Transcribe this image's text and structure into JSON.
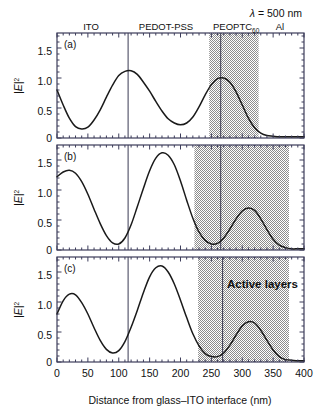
{
  "figure": {
    "wavelength_label": "λ = 500 nm",
    "xlabel": "Distance from glass–ITO interface (nm)",
    "ylabel_main": "|E|",
    "ylabel_exp": "2",
    "active_layers_label": "Active layers",
    "layer_labels": {
      "ito": "ITO",
      "pedot": "PEDOT-PSS",
      "blend_main": "PEOPTC",
      "blend_sub": "60",
      "al": "Al"
    },
    "panel_labels": {
      "a": "(a)",
      "b": "(b)",
      "c": "(c)"
    },
    "xticks": [
      "0",
      "50",
      "100",
      "150",
      "200",
      "250",
      "300",
      "350",
      "400"
    ],
    "yticks": [
      "0",
      "0.5",
      "1.0",
      "1.5"
    ],
    "colors": {
      "curve": "#1a1a1a",
      "axis": "#3c3c5a",
      "shade": "#9a9a9a",
      "interface_line": "#3a3a52",
      "background": "#ffffff"
    }
  },
  "chart_data": {
    "type": "line",
    "title": "",
    "subtitle": "λ = 500 nm",
    "xlabel": "Distance from glass–ITO interface (nm)",
    "ylabel": "|E|^2",
    "xlim": [
      0,
      400
    ],
    "ylim": [
      0,
      1.75
    ],
    "xticks": [
      0,
      50,
      100,
      150,
      200,
      250,
      300,
      350,
      400
    ],
    "yticks": [
      0,
      0.5,
      1.0,
      1.5
    ],
    "grid": false,
    "legend": "none",
    "panels": [
      {
        "label": "(a)",
        "shaded_region": {
          "x0": 220,
          "x1": 300,
          "fill": "hatched-gray",
          "name": "active layers"
        },
        "interface_lines": [
          115,
          265
        ],
        "layer_annotations": [
          {
            "text": "ITO",
            "x": 60
          },
          {
            "text": "PEDOT-PSS",
            "x": 165
          },
          {
            "text": "PEOPTC60",
            "x": 253
          },
          {
            "text": "Al",
            "x": 345
          }
        ],
        "x": [
          0,
          10,
          20,
          30,
          40,
          50,
          60,
          70,
          80,
          90,
          100,
          110,
          120,
          130,
          140,
          150,
          160,
          170,
          180,
          190,
          200,
          210,
          220,
          230,
          240,
          250,
          260,
          270,
          280,
          290,
          300,
          310,
          320,
          330,
          340,
          350,
          360,
          380,
          400
        ],
        "y": [
          0.8,
          0.55,
          0.33,
          0.19,
          0.15,
          0.18,
          0.3,
          0.47,
          0.68,
          0.88,
          1.04,
          1.11,
          1.12,
          1.06,
          0.93,
          0.78,
          0.61,
          0.45,
          0.32,
          0.25,
          0.22,
          0.25,
          0.35,
          0.52,
          0.72,
          0.89,
          0.99,
          1.0,
          0.93,
          0.77,
          0.55,
          0.33,
          0.17,
          0.08,
          0.04,
          0.03,
          0.02,
          0.02,
          0.02
        ]
      },
      {
        "label": "(b)",
        "shaded_region": {
          "x0": 222,
          "x1": 355,
          "fill": "solid-gray",
          "name": "active layers"
        },
        "interface_lines": [
          115,
          265
        ],
        "x": [
          0,
          10,
          20,
          30,
          40,
          50,
          60,
          70,
          80,
          90,
          100,
          110,
          120,
          130,
          140,
          150,
          160,
          170,
          180,
          190,
          200,
          210,
          220,
          230,
          240,
          250,
          260,
          270,
          280,
          290,
          300,
          310,
          320,
          330,
          340,
          350,
          360,
          370,
          380,
          390,
          400
        ],
        "y": [
          1.22,
          1.3,
          1.33,
          1.28,
          1.14,
          0.93,
          0.68,
          0.44,
          0.24,
          0.12,
          0.1,
          0.2,
          0.42,
          0.72,
          1.03,
          1.32,
          1.53,
          1.62,
          1.58,
          1.42,
          1.15,
          0.83,
          0.53,
          0.3,
          0.16,
          0.1,
          0.11,
          0.2,
          0.35,
          0.52,
          0.65,
          0.7,
          0.66,
          0.52,
          0.34,
          0.18,
          0.08,
          0.04,
          0.02,
          0.02,
          0.02
        ]
      },
      {
        "label": "(c)",
        "shaded_region": {
          "x0": 228,
          "x1": 355,
          "fill": "solid-gray",
          "name": "active layers"
        },
        "interface_lines": [
          115,
          268
        ],
        "annotation": "Active layers",
        "x": [
          0,
          10,
          20,
          30,
          40,
          50,
          60,
          70,
          80,
          90,
          100,
          110,
          120,
          130,
          140,
          150,
          160,
          170,
          180,
          190,
          200,
          210,
          220,
          230,
          240,
          250,
          260,
          270,
          280,
          290,
          300,
          310,
          320,
          330,
          340,
          350,
          360,
          370,
          380,
          390,
          400
        ],
        "y": [
          0.8,
          1.02,
          1.13,
          1.12,
          0.99,
          0.8,
          0.57,
          0.36,
          0.21,
          0.15,
          0.19,
          0.34,
          0.58,
          0.86,
          1.16,
          1.42,
          1.57,
          1.6,
          1.5,
          1.3,
          1.03,
          0.74,
          0.47,
          0.27,
          0.14,
          0.09,
          0.09,
          0.15,
          0.28,
          0.45,
          0.6,
          0.67,
          0.65,
          0.53,
          0.36,
          0.2,
          0.09,
          0.04,
          0.03,
          0.02,
          0.02
        ]
      }
    ]
  }
}
